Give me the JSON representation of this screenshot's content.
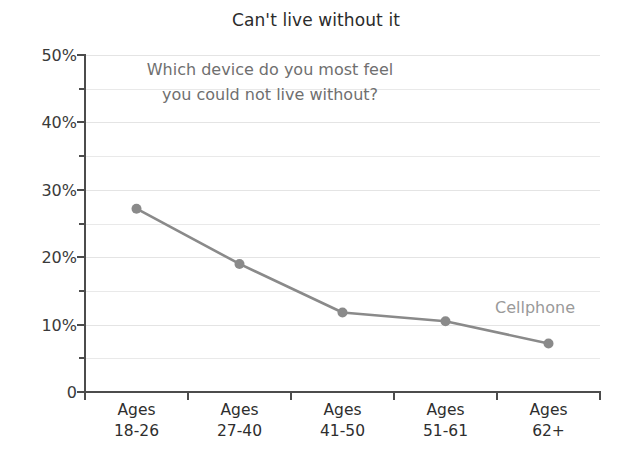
{
  "chart_data": {
    "type": "line",
    "title": "Can't live without it",
    "annotation": {
      "line1": "Which device do you most feel",
      "line2": "you could not live without?"
    },
    "categories": [
      "Ages 18-26",
      "Ages 27-40",
      "Ages 41-50",
      "Ages 51-61",
      "Ages 62+"
    ],
    "category_lines": [
      {
        "line1": "Ages",
        "line2": "18-26"
      },
      {
        "line1": "Ages",
        "line2": "27-40"
      },
      {
        "line1": "Ages",
        "line2": "41-50"
      },
      {
        "line1": "Ages",
        "line2": "51-61"
      },
      {
        "line1": "Ages",
        "line2": "62+"
      }
    ],
    "series": [
      {
        "name": "Cellphone",
        "values": [
          27.2,
          19.0,
          11.8,
          10.5,
          7.2
        ],
        "color": "#8a8a8a"
      }
    ],
    "xlabel": "",
    "ylabel": "",
    "ylim": [
      0,
      50
    ],
    "y_ticks_major": [
      0,
      10,
      20,
      30,
      40,
      50
    ],
    "y_ticks_minor": [
      5,
      15,
      25,
      35,
      45
    ],
    "y_tick_labels": [
      "0",
      "10%",
      "20%",
      "30%",
      "40%",
      "50%"
    ],
    "grid": true,
    "legend_position": "inline-right",
    "colors": {
      "line": "#8a8a8a",
      "marker": "#8a8a8a",
      "gridline": "#e9e9e9",
      "axis": "#4c4c4c",
      "title": "#2b2b2b",
      "annotation": "#6f6f6f",
      "series_label": "#9a9a9a",
      "background": "#ffffff"
    }
  }
}
